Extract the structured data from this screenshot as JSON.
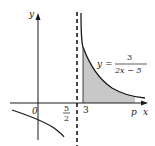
{
  "figure": {
    "type": "function-graph",
    "function_label": {
      "lhs": "y =",
      "numerator": "3",
      "denominator": "2x − 5"
    },
    "axes": {
      "x_label": "x",
      "y_label": "y",
      "origin_label": "0"
    },
    "asymptote": {
      "style": "dashed",
      "label_numerator": "5",
      "label_denominator": "2"
    },
    "marks": {
      "lower_bound_label": "3",
      "upper_bound_label": "p"
    },
    "shaded_region": {
      "description": "area under curve between x = 3 and x = p",
      "fill_color": "#c8c8c8"
    },
    "colors": {
      "line": "#1a1a1a",
      "shade": "#c8c8c8",
      "background": "#ffffff"
    }
  }
}
